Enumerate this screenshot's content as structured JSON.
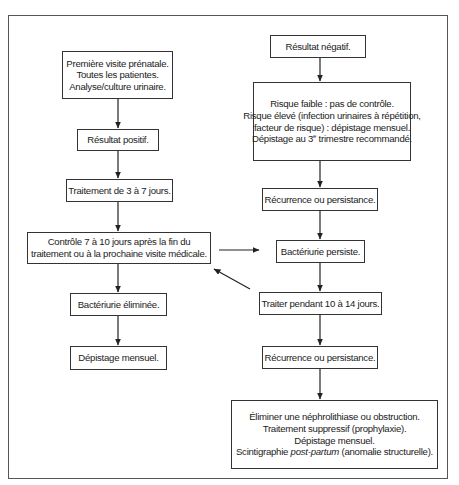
{
  "diagram": {
    "type": "flowchart",
    "language": "fr",
    "left_branch": {
      "initial_visit": {
        "lines": [
          "Première visite prénatale.",
          "Toutes les patientes.",
          "Analyse/culture urinaire."
        ]
      },
      "positive_result": {
        "lines": [
          "Résultat positif."
        ]
      },
      "treatment_3_7": {
        "lines": [
          "Traitement de 3 à 7 jours."
        ]
      },
      "control": {
        "lines": [
          "Contrôle 7 à 10 jours après la fin du",
          "traitement ou à la prochaine visite médicale."
        ]
      },
      "eliminated": {
        "lines": [
          "Bactériurie éliminée."
        ]
      },
      "monthly_screening": {
        "lines": [
          "Dépistage mensuel."
        ]
      }
    },
    "right_branch": {
      "negative_result": {
        "lines": [
          "Résultat négatif."
        ]
      },
      "risk": {
        "lines": [
          "Risque faible : pas de contrôle.",
          "Risque élevé (infection urinaires à répétition,",
          "facteur de risque) : dépistage mensuel."
        ],
        "last_line_prefix": "Dépistage au 3",
        "last_line_sup": "e",
        "last_line_suffix": " trimestre recommandé."
      },
      "recurrence_1": {
        "lines": [
          "Récurrence ou persistance."
        ]
      },
      "persists": {
        "lines": [
          "Bactériurie persiste."
        ]
      },
      "treat_10_14": {
        "lines": [
          "Traiter pendant 10 à 14 jours."
        ]
      },
      "recurrence_2": {
        "lines": [
          "Récurrence ou persistance."
        ]
      },
      "final": {
        "lines": [
          "Éliminer une néphrolithiase ou obstruction.",
          "Traitement suppressif (prophylaxie).",
          "Dépistage mensuel."
        ],
        "last_line_prefix": "Scintigraphie ",
        "last_line_italic": "post-partum",
        "last_line_suffix": " (anomalie structurelle)."
      }
    },
    "connections": [
      {
        "from": "initial_visit",
        "to": "positive_result"
      },
      {
        "from": "positive_result",
        "to": "treatment_3_7"
      },
      {
        "from": "treatment_3_7",
        "to": "control"
      },
      {
        "from": "control",
        "to": "eliminated"
      },
      {
        "from": "eliminated",
        "to": "monthly_screening"
      },
      {
        "from": "negative_result",
        "to": "risk"
      },
      {
        "from": "risk",
        "to": "recurrence_1"
      },
      {
        "from": "recurrence_1",
        "to": "persists"
      },
      {
        "from": "control",
        "to": "persists"
      },
      {
        "from": "persists",
        "to": "treat_10_14"
      },
      {
        "from": "treat_10_14",
        "to": "control"
      },
      {
        "from": "treat_10_14",
        "to": "recurrence_2"
      },
      {
        "from": "recurrence_2",
        "to": "final"
      }
    ],
    "colors": {
      "line": "#333333",
      "frame": "#555555",
      "text": "#222222",
      "background": "#ffffff"
    }
  }
}
